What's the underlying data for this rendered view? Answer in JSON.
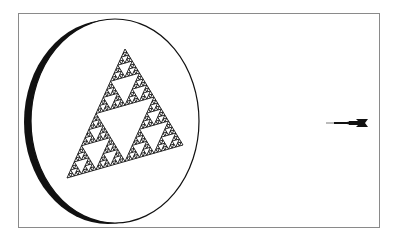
{
  "figure": {
    "elements": [
      {
        "name": "disc",
        "icon": "ellipse-disc"
      },
      {
        "name": "sierpinski-triangle",
        "icon": "fractal-triangle",
        "iterations": 5
      },
      {
        "name": "dart",
        "icon": "dart-icon"
      }
    ]
  },
  "colors": {
    "frame": "#8a8a8a",
    "ink": "#111111",
    "background": "#ffffff"
  }
}
